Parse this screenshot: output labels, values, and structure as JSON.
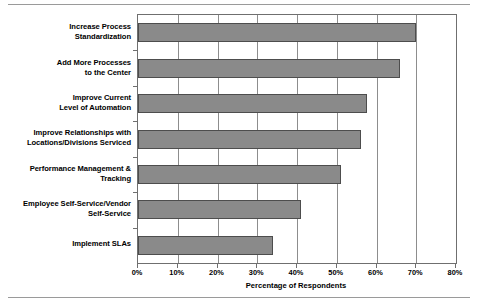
{
  "chart_data": {
    "type": "bar",
    "orientation": "horizontal",
    "title": "",
    "xlabel": "Percentage of Respondents",
    "ylabel": "",
    "xlim": [
      0,
      80
    ],
    "xticks": [
      0,
      10,
      20,
      30,
      40,
      50,
      60,
      70,
      80
    ],
    "xtick_labels": [
      "0%",
      "10%",
      "20%",
      "30%",
      "40%",
      "50%",
      "60%",
      "70%",
      "80%"
    ],
    "grid": true,
    "grid_axis": "x",
    "legend": false,
    "bar_color": "#8a8a8a",
    "bar_edge_color": "#4d4d4d",
    "categories": [
      "Increase Process\nStandardization",
      "Add More Processes\nto the Center",
      "Improve Current\nLevel of Automation",
      "Improve Relationships with\nLocations/Divisions Serviced",
      "Performance Management &\nTracking",
      "Employee Self-Service/Vendor\nSelf-Service",
      "Implement SLAs"
    ],
    "values": [
      70,
      66,
      57.5,
      56,
      51,
      41,
      34
    ],
    "units": "percent"
  },
  "axis": {
    "x_title": "Percentage of Respondents"
  }
}
